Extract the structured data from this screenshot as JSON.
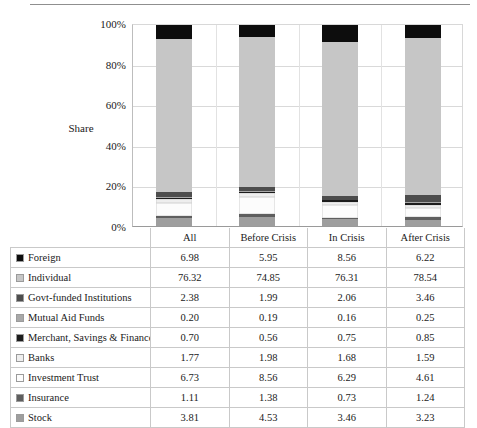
{
  "chart_data": {
    "type": "bar",
    "subtype": "100% stacked column with data table",
    "title": "",
    "xlabel": "",
    "ylabel": "Share",
    "ylim": [
      0,
      100
    ],
    "ytick_labels": [
      "100%",
      "80%",
      "60%",
      "40%",
      "20%",
      "0%"
    ],
    "ytick_values": [
      100,
      80,
      60,
      40,
      20,
      0
    ],
    "grid": true,
    "legend_position": "data-table-left",
    "categories": [
      "All",
      "Before Crisis",
      "In Crisis",
      "After Crisis"
    ],
    "stack_order_bottom_to_top": [
      "Stock",
      "Insurance",
      "Investment Trust",
      "Banks",
      "Merchant, Savings & Finance",
      "Mutual Aid Funds",
      "Govt-funded Institutions",
      "Individual",
      "Foreign"
    ],
    "series": [
      {
        "name": "Foreign",
        "color": "#0d0d0d",
        "values": [
          6.98,
          5.95,
          8.56,
          6.22
        ]
      },
      {
        "name": "Individual",
        "color": "#c6c6c6",
        "values": [
          76.32,
          74.85,
          76.31,
          78.54
        ]
      },
      {
        "name": "Govt-funded Institutions",
        "color": "#4d4d4d",
        "values": [
          2.38,
          1.99,
          2.06,
          3.46
        ]
      },
      {
        "name": "Mutual Aid Funds",
        "color": "#a8a8a8",
        "values": [
          0.2,
          0.19,
          0.16,
          0.25
        ]
      },
      {
        "name": "Merchant, Savings & Finance",
        "color": "#1c1c1c",
        "values": [
          0.7,
          0.56,
          0.75,
          0.85
        ]
      },
      {
        "name": "Banks",
        "color": "#eeeeee",
        "values": [
          1.77,
          1.98,
          1.68,
          1.59
        ]
      },
      {
        "name": "Investment Trust",
        "color": "#fcfcfc",
        "values": [
          6.73,
          8.56,
          6.29,
          4.61
        ]
      },
      {
        "name": "Insurance",
        "color": "#5e5e5e",
        "values": [
          1.11,
          1.38,
          0.73,
          1.24
        ]
      },
      {
        "name": "Stock",
        "color": "#9e9e9e",
        "values": [
          3.81,
          4.53,
          3.46,
          3.23
        ]
      }
    ]
  },
  "table": {
    "header_corner": "",
    "columns": [
      "All",
      "Before Crisis",
      "In Crisis",
      "After Crisis"
    ],
    "rows": [
      {
        "label": "Foreign",
        "swatch": "#0d0d0d",
        "values": [
          "6.98",
          "5.95",
          "8.56",
          "6.22"
        ]
      },
      {
        "label": "Individual",
        "swatch": "#c6c6c6",
        "values": [
          "76.32",
          "74.85",
          "76.31",
          "78.54"
        ]
      },
      {
        "label": "Govt-funded Institutions",
        "swatch": "#4d4d4d",
        "values": [
          "2.38",
          "1.99",
          "2.06",
          "3.46"
        ]
      },
      {
        "label": "Mutual Aid Funds",
        "swatch": "#a8a8a8",
        "values": [
          "0.20",
          "0.19",
          "0.16",
          "0.25"
        ]
      },
      {
        "label": "Merchant, Savings & Finance",
        "swatch": "#1c1c1c",
        "values": [
          "0.70",
          "0.56",
          "0.75",
          "0.85"
        ]
      },
      {
        "label": "Banks",
        "swatch": "#eeeeee",
        "values": [
          "1.77",
          "1.98",
          "1.68",
          "1.59"
        ]
      },
      {
        "label": "Investment Trust",
        "swatch": "#fcfcfc",
        "values": [
          "6.73",
          "8.56",
          "6.29",
          "4.61"
        ]
      },
      {
        "label": "Insurance",
        "swatch": "#5e5e5e",
        "values": [
          "1.11",
          "1.38",
          "0.73",
          "1.24"
        ]
      },
      {
        "label": "Stock",
        "swatch": "#9e9e9e",
        "values": [
          "3.81",
          "4.53",
          "3.46",
          "3.23"
        ]
      }
    ]
  }
}
